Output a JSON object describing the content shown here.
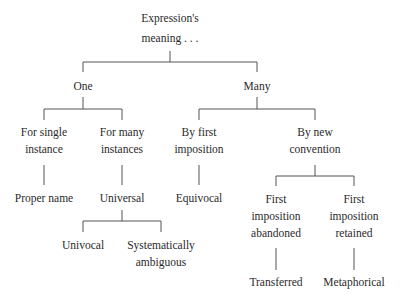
{
  "diagram": {
    "root": {
      "lines": [
        "Expression's",
        "meaning . . ."
      ]
    },
    "one": {
      "lines": [
        "One"
      ]
    },
    "many": {
      "lines": [
        "Many"
      ]
    },
    "single": {
      "lines": [
        "For single",
        "instance"
      ]
    },
    "manyinst": {
      "lines": [
        "For many",
        "instances"
      ]
    },
    "firstimp": {
      "lines": [
        "By first",
        "imposition"
      ]
    },
    "newconv": {
      "lines": [
        "By new",
        "convention"
      ]
    },
    "proper": {
      "lines": [
        "Proper name"
      ]
    },
    "universal": {
      "lines": [
        "Universal"
      ]
    },
    "equivocal": {
      "lines": [
        "Equivocal"
      ]
    },
    "abandoned": {
      "lines": [
        "First",
        "imposition",
        "abandoned"
      ]
    },
    "retained": {
      "lines": [
        "First",
        "imposition",
        "retained"
      ]
    },
    "univocal": {
      "lines": [
        "Univocal"
      ]
    },
    "systematic": {
      "lines": [
        "Systematically",
        "ambiguous"
      ]
    },
    "transferred": {
      "lines": [
        "Transferred"
      ]
    },
    "metaphorical": {
      "lines": [
        "Metaphorical"
      ]
    }
  }
}
